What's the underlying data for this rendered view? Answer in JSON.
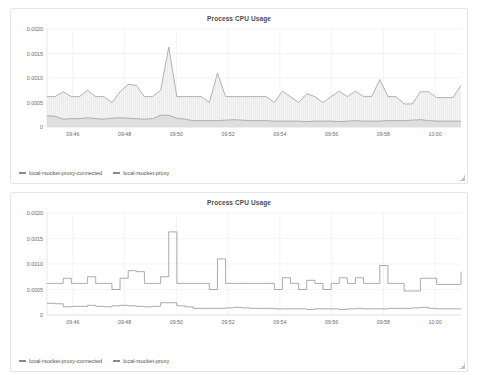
{
  "panels": [
    {
      "title": "Process CPU Usage",
      "render": "area",
      "legend": [
        {
          "label": "local-rsocket-proxy-connected",
          "color": "#8a8a8a"
        },
        {
          "label": "local-rsocket-proxy",
          "color": "#8a8a8a"
        }
      ],
      "resize_handle": "resize-grip-icon"
    },
    {
      "title": "Process CPU Usage",
      "render": "step",
      "legend": [
        {
          "label": "local-rsocket-proxy-connected",
          "color": "#8a8a8a"
        },
        {
          "label": "local-rsocket-proxy",
          "color": "#8a8a8a"
        }
      ],
      "resize_handle": "resize-grip-icon"
    }
  ],
  "chart_data": {
    "type": "line",
    "title": "Process CPU Usage",
    "xlabel": "",
    "ylabel": "",
    "ylim": [
      0,
      0.002
    ],
    "yticks": [
      0,
      0.0005,
      0.001,
      0.0015,
      0.002
    ],
    "ytick_labels": [
      "0",
      "0.0005",
      "0.0010",
      "0.0015",
      "0.0020"
    ],
    "xticks": [
      "09:46",
      "09:48",
      "09:50",
      "09:52",
      "09:54",
      "09:56",
      "09:58",
      "10:00"
    ],
    "xlim": [
      "09:45",
      "10:00"
    ],
    "grid": true,
    "legend_position": "bottom-left",
    "x": [
      "09:45.2",
      "09:45.5",
      "09:45.8",
      "09:46.1",
      "09:46.4",
      "09:46.7",
      "09:47.0",
      "09:47.3",
      "09:47.6",
      "09:47.9",
      "09:48.2",
      "09:48.5",
      "09:48.8",
      "09:49.1",
      "09:49.4",
      "09:49.5",
      "09:49.7",
      "09:50.0",
      "09:50.3",
      "09:50.6",
      "09:50.9",
      "09:51.1",
      "09:51.4",
      "09:51.7",
      "09:52.0",
      "09:52.3",
      "09:52.6",
      "09:52.9",
      "09:53.2",
      "09:53.5",
      "09:53.8",
      "09:54.1",
      "09:54.4",
      "09:54.7",
      "09:55.0",
      "09:55.3",
      "09:55.6",
      "09:55.9",
      "09:56.2",
      "09:56.5",
      "09:56.8",
      "09:57.1",
      "09:57.4",
      "09:57.7",
      "09:58.0",
      "09:58.3",
      "09:58.6",
      "09:58.9",
      "09:59.2",
      "09:59.5",
      "09:59.8",
      "10:00.0"
    ],
    "series": [
      {
        "name": "local-rsocket-proxy-connected",
        "color": "#9b9b9b",
        "values": [
          0.00062,
          0.00062,
          0.00072,
          0.00062,
          0.00062,
          0.00075,
          0.00062,
          0.00062,
          0.0005,
          0.00072,
          0.00087,
          0.00085,
          0.00062,
          0.00062,
          0.00075,
          0.00163,
          0.00062,
          0.00062,
          0.00062,
          0.00062,
          0.0005,
          0.0011,
          0.00062,
          0.00062,
          0.00062,
          0.00062,
          0.00062,
          0.00062,
          0.0005,
          0.00073,
          0.00062,
          0.0005,
          0.00068,
          0.00062,
          0.0005,
          0.00062,
          0.00073,
          0.00062,
          0.00073,
          0.00062,
          0.00062,
          0.00097,
          0.00062,
          0.00062,
          0.00047,
          0.00047,
          0.00072,
          0.00072,
          0.0006,
          0.0006,
          0.0006,
          0.00085
        ]
      },
      {
        "name": "local-rsocket-proxy",
        "color": "#8f8f8f",
        "values": [
          0.00023,
          0.00022,
          0.00016,
          0.00017,
          0.00017,
          0.00019,
          0.00017,
          0.00016,
          0.00018,
          0.00019,
          0.00018,
          0.00017,
          0.00016,
          0.00017,
          0.00024,
          0.00024,
          0.00018,
          0.00016,
          0.00013,
          0.00013,
          0.00013,
          0.00013,
          0.00014,
          0.00015,
          0.00014,
          0.00013,
          0.00013,
          0.00013,
          0.00012,
          0.00012,
          0.00012,
          0.00012,
          0.00011,
          0.00012,
          0.00012,
          0.00012,
          0.00011,
          0.00012,
          0.00013,
          0.00012,
          0.00012,
          0.00012,
          0.00013,
          0.00013,
          0.00013,
          0.00014,
          0.00015,
          0.00013,
          0.00012,
          0.00012,
          0.00012,
          0.00012
        ]
      }
    ]
  }
}
